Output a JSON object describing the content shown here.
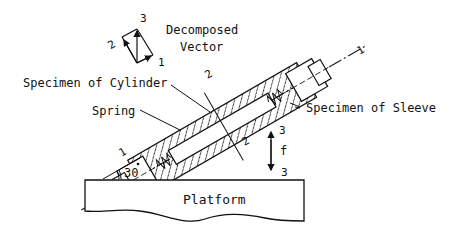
{
  "diagram": {
    "labels": {
      "decomposed_line1": "Decomposed",
      "decomposed_line2": "Vector",
      "cylinder": "Specimen of Cylinder",
      "spring": "Spring",
      "sleeve": "Specimen of Sleeve",
      "platform": "Platform",
      "angle": "30",
      "force": "f"
    },
    "axis_marks": {
      "vec_1": "1",
      "vec_2": "2",
      "vec_3": "3",
      "axis1_top": "1",
      "axis1_bottom": "1",
      "axis2_top": "2",
      "axis2_bottom": "2",
      "axis3_top": "3",
      "axis3_bottom": "3"
    },
    "tilt_angle_deg": 30,
    "stroke_color": "#111111"
  }
}
